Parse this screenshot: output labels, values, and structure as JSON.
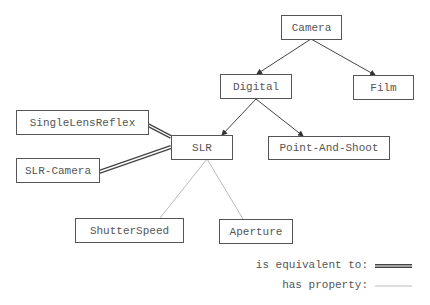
{
  "nodes": {
    "camera": "Camera",
    "digital": "Digital",
    "film": "Film",
    "slr": "SLR",
    "point_and_shoot": "Point-And-Shoot",
    "single_lens_reflex": "SingleLensReflex",
    "slr_camera": "SLR-Camera",
    "shutter_speed": "ShutterSpeed",
    "aperture": "Aperture"
  },
  "legend": {
    "equivalent": "is equivalent to:",
    "property": "has property:"
  },
  "colors": {
    "edge": "#444444",
    "property_edge": "#bbbbbb",
    "node_border": "#555555"
  }
}
